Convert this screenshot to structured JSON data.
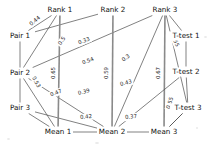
{
  "diagram": {
    "type": "network-graph",
    "title": "",
    "nodes": [
      {
        "id": "rank1",
        "label": "Rank 1",
        "x": 60,
        "y": 10,
        "anchor": "middle"
      },
      {
        "id": "rank2",
        "label": "Rank 2",
        "x": 113,
        "y": 10,
        "anchor": "middle"
      },
      {
        "id": "rank3",
        "label": "Rank 3",
        "x": 165,
        "y": 10,
        "anchor": "middle"
      },
      {
        "id": "ttest1",
        "label": "T-test 1",
        "x": 186,
        "y": 36,
        "anchor": "middle"
      },
      {
        "id": "ttest2",
        "label": "T-test 2",
        "x": 186,
        "y": 72,
        "anchor": "middle"
      },
      {
        "id": "ttest3",
        "label": "T-test 3",
        "x": 188,
        "y": 108,
        "anchor": "middle"
      },
      {
        "id": "mean3",
        "label": "Mean 3",
        "x": 164,
        "y": 132,
        "anchor": "middle"
      },
      {
        "id": "mean2",
        "label": "Mean 2",
        "x": 112,
        "y": 132,
        "anchor": "middle"
      },
      {
        "id": "mean1",
        "label": "Mean 1",
        "x": 58,
        "y": 132,
        "anchor": "middle"
      },
      {
        "id": "pair3",
        "label": "Pair 3",
        "x": 20,
        "y": 108,
        "anchor": "middle"
      },
      {
        "id": "pair2",
        "label": "Pair 2",
        "x": 20,
        "y": 73,
        "anchor": "middle"
      },
      {
        "id": "pair1",
        "label": "Pair 1",
        "x": 20,
        "y": 36,
        "anchor": "middle"
      }
    ],
    "edges": [
      {
        "id": "e1",
        "source": "pair1",
        "target": "rank1",
        "weight": "0.44",
        "lx": 35,
        "ly": 21,
        "rot": -40,
        "thick": false
      },
      {
        "id": "e2",
        "source": "pair2",
        "target": "rank1",
        "weight": "0.5",
        "lx": 62,
        "ly": 41,
        "rot": -56,
        "thick": false
      },
      {
        "id": "e3",
        "source": "pair1",
        "target": "rank2",
        "weight": "0.33",
        "lx": 84,
        "ly": 41,
        "rot": -22,
        "thick": false
      },
      {
        "id": "e4",
        "source": "pair2",
        "target": "rank3",
        "weight": "0.54",
        "lx": 88,
        "ly": 61,
        "rot": -22,
        "thick": false
      },
      {
        "id": "e5",
        "source": "rank3",
        "target": "mean2",
        "weight": "0.3",
        "lx": 126,
        "ly": 58,
        "rot": -38,
        "thick": false
      },
      {
        "id": "e6",
        "source": "rank3",
        "target": "ttest1",
        "weight": "0.55",
        "lx": 175,
        "ly": 41,
        "rot": 66,
        "thick": false
      },
      {
        "id": "e7",
        "source": "pair2",
        "target": "mean1",
        "weight": "0.53",
        "lx": 36,
        "ly": 82,
        "rot": 62,
        "thick": false
      },
      {
        "id": "e8",
        "source": "rank1",
        "target": "mean1",
        "weight": "0.65",
        "lx": 54,
        "ly": 73,
        "rot": -90,
        "thick": true
      },
      {
        "id": "e9",
        "source": "rank2",
        "target": "mean2",
        "weight": "0.59",
        "lx": 107,
        "ly": 73,
        "rot": -90,
        "thick": true
      },
      {
        "id": "e10",
        "source": "rank3",
        "target": "mean3",
        "weight": "0.67",
        "lx": 159,
        "ly": 73,
        "rot": -90,
        "thick": true
      },
      {
        "id": "e11",
        "source": "pair3",
        "target": "mean2",
        "weight": "0.47",
        "lx": 56,
        "ly": 93,
        "rot": -22,
        "thick": false
      },
      {
        "id": "e12",
        "source": "pair2",
        "target": "mean2",
        "weight": "0.39",
        "lx": 84,
        "ly": 92,
        "rot": -16,
        "thick": false
      },
      {
        "id": "e13",
        "source": "ttest2",
        "target": "mean2",
        "weight": "0.43",
        "lx": 126,
        "ly": 83,
        "rot": -14,
        "thick": false
      },
      {
        "id": "e14",
        "source": "mean1",
        "target": "mean2",
        "weight": "0.42",
        "lx": 86,
        "ly": 117,
        "rot": -6,
        "thick": false
      },
      {
        "id": "e15",
        "source": "mean2",
        "target": "mean3",
        "weight": "0.37",
        "lx": 131,
        "ly": 117,
        "rot": -6,
        "thick": false
      },
      {
        "id": "e16",
        "source": "ttest3",
        "target": "mean3",
        "weight": "0.55",
        "lx": 170,
        "ly": 103,
        "rot": -72,
        "thick": false
      }
    ],
    "connections": [
      {
        "from": "pair1",
        "to": "rank1"
      },
      {
        "from": "pair1",
        "to": "rank2"
      },
      {
        "from": "pair1",
        "to": "pair2"
      },
      {
        "from": "pair2",
        "to": "rank1"
      },
      {
        "from": "pair2",
        "to": "rank3"
      },
      {
        "from": "pair2",
        "to": "mean1"
      },
      {
        "from": "pair2",
        "to": "mean2"
      },
      {
        "from": "pair2",
        "to": "pair3"
      },
      {
        "from": "pair3",
        "to": "mean1"
      },
      {
        "from": "pair3",
        "to": "mean2"
      },
      {
        "from": "rank1",
        "to": "mean1"
      },
      {
        "from": "rank2",
        "to": "mean2"
      },
      {
        "from": "rank3",
        "to": "mean2"
      },
      {
        "from": "rank3",
        "to": "mean3"
      },
      {
        "from": "rank3",
        "to": "ttest1"
      },
      {
        "from": "rank3",
        "to": "ttest3"
      },
      {
        "from": "ttest1",
        "to": "ttest2"
      },
      {
        "from": "ttest2",
        "to": "mean2"
      },
      {
        "from": "ttest2",
        "to": "ttest3"
      },
      {
        "from": "ttest3",
        "to": "mean3"
      },
      {
        "from": "mean1",
        "to": "mean2"
      },
      {
        "from": "mean2",
        "to": "mean3"
      },
      {
        "from": "mean3",
        "to": "ttest3"
      }
    ]
  }
}
